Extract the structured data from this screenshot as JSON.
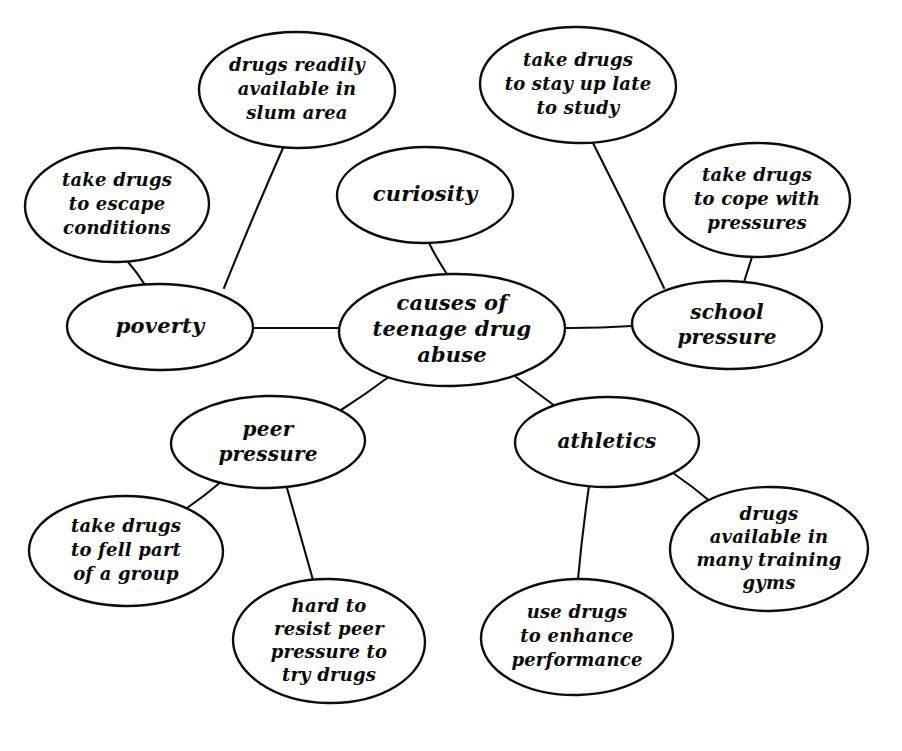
{
  "document": {
    "kind": "hand-drawn concept map",
    "central_topic": "causes of teenage drug abuse",
    "background_color": "#ffffff",
    "ink_color": "#0d0d0d"
  },
  "nodes": [
    {
      "id": "center",
      "name": "causes-of-teenage-drug-abuse",
      "lines": [
        "causes of",
        "teenage drug",
        "abuse"
      ],
      "cx": 452,
      "cy": 330,
      "rx": 113,
      "ry": 56,
      "font_size": 21,
      "line_height": 26
    },
    {
      "id": "curiosity",
      "name": "curiosity",
      "lines": [
        "curiosity"
      ],
      "cx": 425,
      "cy": 195,
      "rx": 88,
      "ry": 48,
      "font_size": 21,
      "line_height": 26
    },
    {
      "id": "poverty",
      "name": "poverty",
      "lines": [
        "poverty"
      ],
      "cx": 160,
      "cy": 327,
      "rx": 93,
      "ry": 43,
      "font_size": 21,
      "line_height": 26
    },
    {
      "id": "school-pressure",
      "name": "school-pressure",
      "lines": [
        "school",
        "pressure"
      ],
      "cx": 727,
      "cy": 325,
      "rx": 95,
      "ry": 44,
      "font_size": 20,
      "line_height": 25
    },
    {
      "id": "peer-pressure",
      "name": "peer-pressure",
      "lines": [
        "peer",
        "pressure"
      ],
      "cx": 268,
      "cy": 442,
      "rx": 97,
      "ry": 46,
      "font_size": 20,
      "line_height": 25
    },
    {
      "id": "athletics",
      "name": "athletics",
      "lines": [
        "athletics"
      ],
      "cx": 607,
      "cy": 442,
      "rx": 92,
      "ry": 45,
      "font_size": 20,
      "line_height": 25
    },
    {
      "id": "drugs-slum-area",
      "name": "drugs-readily-available-in-slum-area",
      "lines": [
        "drugs readily",
        "available in",
        "slum area"
      ],
      "cx": 297,
      "cy": 90,
      "rx": 98,
      "ry": 58,
      "font_size": 18,
      "line_height": 24
    },
    {
      "id": "stay-up-late",
      "name": "take-drugs-to-stay-up-late-to-study",
      "lines": [
        "take drugs",
        "to stay up late",
        "to study"
      ],
      "cx": 578,
      "cy": 85,
      "rx": 98,
      "ry": 58,
      "font_size": 18,
      "line_height": 24
    },
    {
      "id": "escape-conditions",
      "name": "take-drugs-to-escape-conditions",
      "lines": [
        "take drugs",
        "to escape",
        "conditions"
      ],
      "cx": 117,
      "cy": 205,
      "rx": 92,
      "ry": 57,
      "font_size": 18,
      "line_height": 24
    },
    {
      "id": "cope-with-pressures",
      "name": "take-drugs-to-cope-with-pressures",
      "lines": [
        "take drugs",
        "to cope with",
        "pressures"
      ],
      "cx": 757,
      "cy": 200,
      "rx": 93,
      "ry": 57,
      "font_size": 18,
      "line_height": 24
    },
    {
      "id": "feel-part-of-group",
      "name": "take-drugs-to-fell-part-of-a-group",
      "lines": [
        "take drugs",
        "to fell part",
        "of a group"
      ],
      "cx": 126,
      "cy": 551,
      "rx": 97,
      "ry": 55,
      "font_size": 18,
      "line_height": 24
    },
    {
      "id": "hard-to-resist",
      "name": "hard-to-resist-peer-pressure-to-try-drugs",
      "lines": [
        "hard to",
        "resist peer",
        "pressure to",
        "try drugs"
      ],
      "cx": 329,
      "cy": 641,
      "rx": 96,
      "ry": 62,
      "font_size": 18,
      "line_height": 23
    },
    {
      "id": "enhance-performance",
      "name": "use-drugs-to-enhance-performance",
      "lines": [
        "use drugs",
        "to enhance",
        "performance"
      ],
      "cx": 577,
      "cy": 637,
      "rx": 96,
      "ry": 58,
      "font_size": 18,
      "line_height": 24
    },
    {
      "id": "training-gyms",
      "name": "drugs-available-in-many-training-gyms",
      "lines": [
        "drugs",
        "available in",
        "many training",
        "gyms"
      ],
      "cx": 769,
      "cy": 549,
      "rx": 99,
      "ry": 62,
      "font_size": 18,
      "line_height": 23
    }
  ],
  "edges": [
    {
      "name": "edge-center-to-curiosity",
      "from": "center",
      "to": "curiosity",
      "x1": 447,
      "y1": 274,
      "x2": 429,
      "y2": 243
    },
    {
      "name": "edge-center-to-poverty",
      "from": "center",
      "to": "poverty",
      "x1": 339,
      "y1": 328,
      "x2": 253,
      "y2": 328
    },
    {
      "name": "edge-center-to-school-pressure",
      "from": "center",
      "to": "school-pressure",
      "x1": 565,
      "y1": 328,
      "x2": 632,
      "y2": 326
    },
    {
      "name": "edge-center-to-peer-pressure",
      "from": "center",
      "to": "peer-pressure",
      "x1": 390,
      "y1": 376,
      "x2": 338,
      "y2": 412
    },
    {
      "name": "edge-center-to-athletics",
      "from": "center",
      "to": "athletics",
      "x1": 516,
      "y1": 377,
      "x2": 559,
      "y2": 409
    },
    {
      "name": "edge-poverty-to-escape-conditions",
      "from": "poverty",
      "to": "escape-conditions",
      "x1": 145,
      "y1": 285,
      "x2": 128,
      "y2": 262
    },
    {
      "name": "edge-poverty-to-slum-area",
      "from": "poverty",
      "to": "drugs-slum-area",
      "x1": 224,
      "y1": 288,
      "x2": 283,
      "y2": 148
    },
    {
      "name": "edge-school-pressure-to-cope",
      "from": "school-pressure",
      "to": "cope-with-pressures",
      "x1": 744,
      "y1": 282,
      "x2": 752,
      "y2": 257
    },
    {
      "name": "edge-school-pressure-to-stay-up-late",
      "from": "school-pressure",
      "to": "stay-up-late",
      "x1": 664,
      "y1": 288,
      "x2": 593,
      "y2": 143
    },
    {
      "name": "edge-peer-pressure-to-feel-part",
      "from": "peer-pressure",
      "to": "feel-part-of-group",
      "x1": 222,
      "y1": 481,
      "x2": 187,
      "y2": 508
    },
    {
      "name": "edge-peer-pressure-to-hard-resist",
      "from": "peer-pressure",
      "to": "hard-to-resist",
      "x1": 287,
      "y1": 488,
      "x2": 313,
      "y2": 580
    },
    {
      "name": "edge-athletics-to-enhance",
      "from": "athletics",
      "to": "enhance-performance",
      "x1": 589,
      "y1": 486,
      "x2": 578,
      "y2": 579
    },
    {
      "name": "edge-athletics-to-training-gyms",
      "from": "athletics",
      "to": "training-gyms",
      "x1": 673,
      "y1": 473,
      "x2": 711,
      "y2": 502
    }
  ]
}
